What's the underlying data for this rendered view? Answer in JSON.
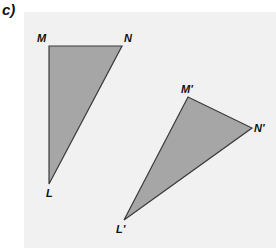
{
  "part_label": "c)",
  "colors": {
    "panel": "#f1f1f1",
    "fill": "#a6a6a6",
    "stroke": "#3a3a3a"
  },
  "triangle_original": {
    "points": "49,46 122,46 49,184",
    "vertices": {
      "M": "M",
      "N": "N",
      "L": "L"
    }
  },
  "triangle_image": {
    "points": "188,97 252,128 124,220",
    "vertices": {
      "M": "M'",
      "N": "N'",
      "L": "L'"
    }
  }
}
